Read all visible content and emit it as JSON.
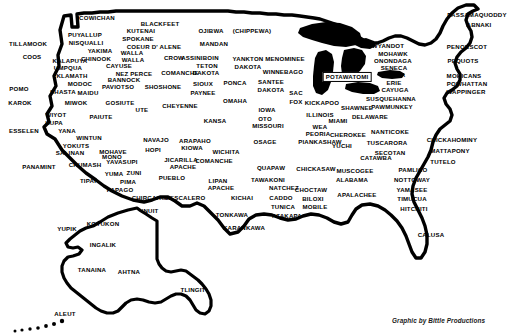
{
  "map": {
    "title": "Native American Tribes of North America",
    "credit": "Graphic by Bittle Productions",
    "credit_position": {
      "x": 392,
      "y": 317
    },
    "background_color": "#ffffff",
    "ink_color": "#000000",
    "regions": [
      {
        "name": "contiguous-united-states",
        "label": "Contiguous United States"
      },
      {
        "name": "alaska-inset",
        "label": "Alaska"
      },
      {
        "name": "great-lakes",
        "label": "Great Lakes"
      }
    ],
    "labels": [
      {
        "text": "COWICHAN",
        "x": 97,
        "y": 18,
        "style": "plain"
      },
      {
        "text": "PUYALLUP",
        "x": 85,
        "y": 35,
        "style": "plain"
      },
      {
        "text": "NISQUALLI",
        "x": 86,
        "y": 43,
        "style": "plain"
      },
      {
        "text": "YAKIMA",
        "x": 100,
        "y": 51,
        "style": "plain"
      },
      {
        "text": "KALAPUYA",
        "x": 70,
        "y": 61,
        "style": "plain"
      },
      {
        "text": "CHINOOK",
        "x": 96,
        "y": 59,
        "style": "plain"
      },
      {
        "text": "UMPQUA",
        "x": 68,
        "y": 68,
        "style": "plain"
      },
      {
        "text": "KLAMATH",
        "x": 72,
        "y": 76,
        "style": "plain"
      },
      {
        "text": "MODOC",
        "x": 80,
        "y": 84,
        "style": "plain"
      },
      {
        "text": "SHASTA",
        "x": 63,
        "y": 92,
        "style": "plain"
      },
      {
        "text": "MAIDU",
        "x": 88,
        "y": 93,
        "style": "plain"
      },
      {
        "text": "MIWOK",
        "x": 76,
        "y": 103,
        "style": "plain"
      },
      {
        "text": "TILLAMOOK",
        "x": 28,
        "y": 44,
        "style": "plain"
      },
      {
        "text": "COOS",
        "x": 32,
        "y": 57,
        "style": "plain"
      },
      {
        "text": "POMO",
        "x": 19,
        "y": 89,
        "style": "plain"
      },
      {
        "text": "KAROK",
        "x": 20,
        "y": 103,
        "style": "plain"
      },
      {
        "text": "WIYOT",
        "x": 56,
        "y": 115,
        "style": "plain"
      },
      {
        "text": "HUPA",
        "x": 54,
        "y": 123,
        "style": "plain"
      },
      {
        "text": "ESSELEN",
        "x": 24,
        "y": 131,
        "style": "plain"
      },
      {
        "text": "YANA",
        "x": 67,
        "y": 131,
        "style": "plain"
      },
      {
        "text": "WINTUN",
        "x": 89,
        "y": 138,
        "style": "plain"
      },
      {
        "text": "YOKUTS",
        "x": 76,
        "y": 146,
        "style": "plain"
      },
      {
        "text": "SALINAN",
        "x": 70,
        "y": 153,
        "style": "plain"
      },
      {
        "text": "PANAMINT",
        "x": 39,
        "y": 167,
        "style": "plain"
      },
      {
        "text": "CHUMASH",
        "x": 85,
        "y": 165,
        "style": "plain"
      },
      {
        "text": "MONO",
        "x": 112,
        "y": 157,
        "style": "plain"
      },
      {
        "text": "MOHAVE",
        "x": 113,
        "y": 152,
        "style": "plain"
      },
      {
        "text": "YAVASUPI",
        "x": 122,
        "y": 162,
        "style": "plain"
      },
      {
        "text": "YUMA",
        "x": 114,
        "y": 174,
        "style": "plain"
      },
      {
        "text": "ZUNI",
        "x": 134,
        "y": 173,
        "style": "plain"
      },
      {
        "text": "PIMA",
        "x": 128,
        "y": 182,
        "style": "plain"
      },
      {
        "text": "TIPAI",
        "x": 88,
        "y": 181,
        "style": "plain"
      },
      {
        "text": "PAPAGO",
        "x": 120,
        "y": 190,
        "style": "plain"
      },
      {
        "text": "CHIRCAHUA",
        "x": 151,
        "y": 198,
        "style": "plain"
      },
      {
        "text": "KUTENAI",
        "x": 141,
        "y": 31,
        "style": "plain"
      },
      {
        "text": "BLACKFEET",
        "x": 160,
        "y": 24,
        "style": "plain"
      },
      {
        "text": "SPOKANE",
        "x": 138,
        "y": 39,
        "style": "plain"
      },
      {
        "text": "COEUR D' ALENE",
        "x": 154,
        "y": 47,
        "style": "plain"
      },
      {
        "text": "WALLA",
        "x": 132,
        "y": 53,
        "style": "plain"
      },
      {
        "text": "WALLA",
        "x": 133,
        "y": 60,
        "style": "plain"
      },
      {
        "text": "CAYUSE",
        "x": 119,
        "y": 66,
        "style": "plain"
      },
      {
        "text": "CROW",
        "x": 174,
        "y": 58,
        "style": "plain"
      },
      {
        "text": "NEZ PERCE",
        "x": 134,
        "y": 74,
        "style": "plain"
      },
      {
        "text": "BANNOCK",
        "x": 124,
        "y": 80,
        "style": "plain"
      },
      {
        "text": "PAVIOTSO",
        "x": 118,
        "y": 87,
        "style": "plain"
      },
      {
        "text": "SHOSHONE",
        "x": 163,
        "y": 87,
        "style": "plain"
      },
      {
        "text": "GOSIUTE",
        "x": 120,
        "y": 103,
        "style": "plain"
      },
      {
        "text": "PAIUTE",
        "x": 101,
        "y": 117,
        "style": "plain"
      },
      {
        "text": "UTE",
        "x": 142,
        "y": 110,
        "style": "plain"
      },
      {
        "text": "NAVAJO",
        "x": 156,
        "y": 140,
        "style": "plain"
      },
      {
        "text": "HOPI",
        "x": 153,
        "y": 150,
        "style": "plain"
      },
      {
        "text": "JICARILLA",
        "x": 181,
        "y": 160,
        "style": "plain"
      },
      {
        "text": "APACHE",
        "x": 183,
        "y": 167,
        "style": "plain"
      },
      {
        "text": "PUEBLO",
        "x": 172,
        "y": 178,
        "style": "plain"
      },
      {
        "text": "MESCALERO",
        "x": 185,
        "y": 198,
        "style": "plain"
      },
      {
        "text": "LIPAN",
        "x": 218,
        "y": 181,
        "style": "plain"
      },
      {
        "text": "APACHE",
        "x": 221,
        "y": 188,
        "style": "plain"
      },
      {
        "text": "ASSINIBOIN",
        "x": 200,
        "y": 58,
        "style": "plain"
      },
      {
        "text": "OJIBWA",
        "x": 211,
        "y": 31,
        "style": "plain"
      },
      {
        "text": "(CHIPPEWA)",
        "x": 252,
        "y": 31,
        "style": "plain"
      },
      {
        "text": "MANDAN",
        "x": 214,
        "y": 44,
        "style": "plain"
      },
      {
        "text": "TETON",
        "x": 207,
        "y": 66,
        "style": "plain"
      },
      {
        "text": "DAKOTA",
        "x": 206,
        "y": 73,
        "style": "plain"
      },
      {
        "text": "SIOUX",
        "x": 203,
        "y": 84,
        "style": "plain"
      },
      {
        "text": "PAYNEE",
        "x": 203,
        "y": 93,
        "style": "plain"
      },
      {
        "text": "YANKTON",
        "x": 248,
        "y": 59,
        "style": "plain"
      },
      {
        "text": "DAKOTA",
        "x": 248,
        "y": 67,
        "style": "plain"
      },
      {
        "text": "PONCA",
        "x": 235,
        "y": 83,
        "style": "plain"
      },
      {
        "text": "OMAHA",
        "x": 235,
        "y": 101,
        "style": "plain"
      },
      {
        "text": "CHEYENNE",
        "x": 180,
        "y": 106,
        "style": "plain"
      },
      {
        "text": "KANSA",
        "x": 215,
        "y": 121,
        "style": "plain"
      },
      {
        "text": "ARAPAHO",
        "x": 195,
        "y": 141,
        "style": "plain"
      },
      {
        "text": "KIOWA",
        "x": 192,
        "y": 148,
        "style": "plain"
      },
      {
        "text": "WICHITA",
        "x": 226,
        "y": 152,
        "style": "plain"
      },
      {
        "text": "COMANCHE",
        "x": 214,
        "y": 161,
        "style": "plain"
      },
      {
        "text": "COMANCHE",
        "x": 180,
        "y": 73,
        "style": "plain"
      },
      {
        "text": "KICHAI",
        "x": 242,
        "y": 198,
        "style": "plain"
      },
      {
        "text": "TONKAWA",
        "x": 232,
        "y": 215,
        "style": "plain"
      },
      {
        "text": "KARANKAWA",
        "x": 244,
        "y": 228,
        "style": "plain"
      },
      {
        "text": "OSAGE",
        "x": 265,
        "y": 142,
        "style": "plain"
      },
      {
        "text": "QUAPAW",
        "x": 271,
        "y": 168,
        "style": "plain"
      },
      {
        "text": "TAWAKONI",
        "x": 268,
        "y": 180,
        "style": "plain"
      },
      {
        "text": "NATCHEZ",
        "x": 284,
        "y": 188,
        "style": "plain"
      },
      {
        "text": "CADDO",
        "x": 281,
        "y": 198,
        "style": "plain"
      },
      {
        "text": "TUNICA",
        "x": 283,
        "y": 207,
        "style": "plain"
      },
      {
        "text": "ATAKAPA",
        "x": 287,
        "y": 216,
        "style": "plain"
      },
      {
        "text": "SANTEE",
        "x": 271,
        "y": 82,
        "style": "plain"
      },
      {
        "text": "DAKOTA",
        "x": 271,
        "y": 90,
        "style": "plain"
      },
      {
        "text": "WINNEBAGO",
        "x": 283,
        "y": 72,
        "style": "plain"
      },
      {
        "text": "MENOMINEE",
        "x": 285,
        "y": 59,
        "style": "plain"
      },
      {
        "text": "SAC",
        "x": 296,
        "y": 93,
        "style": "plain"
      },
      {
        "text": "FOX",
        "x": 296,
        "y": 102,
        "style": "plain"
      },
      {
        "text": "IOWA",
        "x": 267,
        "y": 110,
        "style": "plain"
      },
      {
        "text": "OTO",
        "x": 265,
        "y": 119,
        "style": "plain"
      },
      {
        "text": "MISSOURI",
        "x": 268,
        "y": 126,
        "style": "plain"
      },
      {
        "text": "KICKAPOO",
        "x": 322,
        "y": 103,
        "style": "plain"
      },
      {
        "text": "ILLINOIS",
        "x": 320,
        "y": 115,
        "style": "plain"
      },
      {
        "text": "WEA",
        "x": 320,
        "y": 127,
        "style": "plain"
      },
      {
        "text": "PEORIA",
        "x": 318,
        "y": 134,
        "style": "plain"
      },
      {
        "text": "PIANKASHAW",
        "x": 320,
        "y": 142,
        "style": "plain"
      },
      {
        "text": "POTAWATOMI",
        "x": 347,
        "y": 77,
        "style": "boxed"
      },
      {
        "text": "MIAMI",
        "x": 338,
        "y": 121,
        "style": "plain"
      },
      {
        "text": "SHAWNEE",
        "x": 357,
        "y": 108,
        "style": "plain"
      },
      {
        "text": "DELAWARE",
        "x": 370,
        "y": 117,
        "style": "plain"
      },
      {
        "text": "CHEROKEE",
        "x": 348,
        "y": 135,
        "style": "plain"
      },
      {
        "text": "YUCHI",
        "x": 342,
        "y": 146,
        "style": "plain"
      },
      {
        "text": "MUSCOGEE",
        "x": 355,
        "y": 171,
        "style": "plain"
      },
      {
        "text": "ALABAMA",
        "x": 352,
        "y": 180,
        "style": "plain"
      },
      {
        "text": "APALACHEE",
        "x": 357,
        "y": 195,
        "style": "plain"
      },
      {
        "text": "CHICKASAW",
        "x": 316,
        "y": 169,
        "style": "plain"
      },
      {
        "text": "CHOCTAW",
        "x": 311,
        "y": 190,
        "style": "plain"
      },
      {
        "text": "BILOXI",
        "x": 313,
        "y": 199,
        "style": "plain"
      },
      {
        "text": "MOBILE",
        "x": 315,
        "y": 207,
        "style": "plain"
      },
      {
        "text": "CATAWBA",
        "x": 376,
        "y": 158,
        "style": "plain"
      },
      {
        "text": "NANTICOKE",
        "x": 390,
        "y": 132,
        "style": "plain"
      },
      {
        "text": "TUSCARORA",
        "x": 387,
        "y": 143,
        "style": "plain"
      },
      {
        "text": "SECOTAN",
        "x": 390,
        "y": 153,
        "style": "plain"
      },
      {
        "text": "PAMLICO",
        "x": 413,
        "y": 170,
        "style": "plain"
      },
      {
        "text": "NOTTOWAY",
        "x": 412,
        "y": 180,
        "style": "plain"
      },
      {
        "text": "YAMASEE",
        "x": 412,
        "y": 190,
        "style": "plain"
      },
      {
        "text": "TIMUCUA",
        "x": 412,
        "y": 199,
        "style": "plain"
      },
      {
        "text": "HITCHITI",
        "x": 414,
        "y": 209,
        "style": "plain"
      },
      {
        "text": "CALUSA",
        "x": 431,
        "y": 235,
        "style": "plain"
      },
      {
        "text": "CHICKAHOMINY",
        "x": 452,
        "y": 140,
        "style": "plain"
      },
      {
        "text": "MATTAPONY",
        "x": 450,
        "y": 151,
        "style": "plain"
      },
      {
        "text": "TUTELO",
        "x": 443,
        "y": 162,
        "style": "plain"
      },
      {
        "text": "WYANDOT",
        "x": 388,
        "y": 46,
        "style": "plain"
      },
      {
        "text": "MOHAWK",
        "x": 393,
        "y": 54,
        "style": "plain"
      },
      {
        "text": "ONONDAGA",
        "x": 393,
        "y": 61,
        "style": "plain"
      },
      {
        "text": "SENECA",
        "x": 394,
        "y": 68,
        "style": "plain"
      },
      {
        "text": "ONEIDA",
        "x": 393,
        "y": 75,
        "style": "plain"
      },
      {
        "text": "ERIE",
        "x": 394,
        "y": 83,
        "style": "plain"
      },
      {
        "text": "CAYUGA",
        "x": 395,
        "y": 90,
        "style": "plain"
      },
      {
        "text": "SUSQUEHANNA",
        "x": 391,
        "y": 99,
        "style": "plain"
      },
      {
        "text": "PAWMUNKEY",
        "x": 392,
        "y": 107,
        "style": "plain"
      },
      {
        "text": "PENOBSCOT",
        "x": 467,
        "y": 47,
        "style": "plain"
      },
      {
        "text": "PEQUOTS",
        "x": 463,
        "y": 61,
        "style": "plain"
      },
      {
        "text": "MOHICANS",
        "x": 464,
        "y": 76,
        "style": "plain"
      },
      {
        "text": "POWHATTAN",
        "x": 467,
        "y": 84,
        "style": "plain"
      },
      {
        "text": "WAPPINGER",
        "x": 466,
        "y": 92,
        "style": "plain"
      },
      {
        "text": "PASSAMAQUODDY",
        "x": 477,
        "y": 15,
        "style": "plain"
      },
      {
        "text": "ABNAKI",
        "x": 479,
        "y": 25,
        "style": "plain"
      },
      {
        "text": "INUIT",
        "x": 150,
        "y": 211,
        "style": "plain"
      },
      {
        "text": "YUPIK",
        "x": 67,
        "y": 229,
        "style": "plain"
      },
      {
        "text": "KOYUKON",
        "x": 103,
        "y": 224,
        "style": "plain"
      },
      {
        "text": "INGALIK",
        "x": 103,
        "y": 245,
        "style": "plain"
      },
      {
        "text": "TANAINA",
        "x": 92,
        "y": 270,
        "style": "plain"
      },
      {
        "text": "AHTNA",
        "x": 129,
        "y": 272,
        "style": "plain"
      },
      {
        "text": "TLINGIT",
        "x": 193,
        "y": 290,
        "style": "plain"
      },
      {
        "text": "ALEUT",
        "x": 65,
        "y": 314,
        "style": "plain"
      }
    ]
  }
}
